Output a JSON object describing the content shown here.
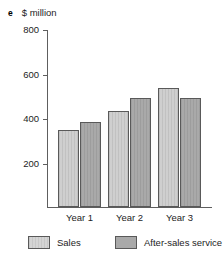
{
  "figure": {
    "item_letter": "e",
    "unit_label": "$ million"
  },
  "chart_data": {
    "type": "bar",
    "title": "",
    "subtitle": "",
    "xlabel": "",
    "ylabel": "$ million",
    "categories": [
      "Year 1",
      "Year 2",
      "Year 3"
    ],
    "series": [
      {
        "name": "Sales",
        "color": "#cfcfcf",
        "values": [
          345,
          430,
          535
        ]
      },
      {
        "name": "After-sales service",
        "color": "#a9a9a9",
        "values": [
          380,
          490,
          490
        ]
      }
    ],
    "ylim": [
      0,
      800
    ],
    "yticks": [
      200,
      400,
      600,
      800
    ],
    "ytick_labels": [
      "200",
      "400",
      "600",
      "800"
    ],
    "grid": false,
    "legend_position": "bottom"
  },
  "legend": {
    "entries": [
      {
        "label": "Sales"
      },
      {
        "label": "After-sales service"
      }
    ]
  }
}
